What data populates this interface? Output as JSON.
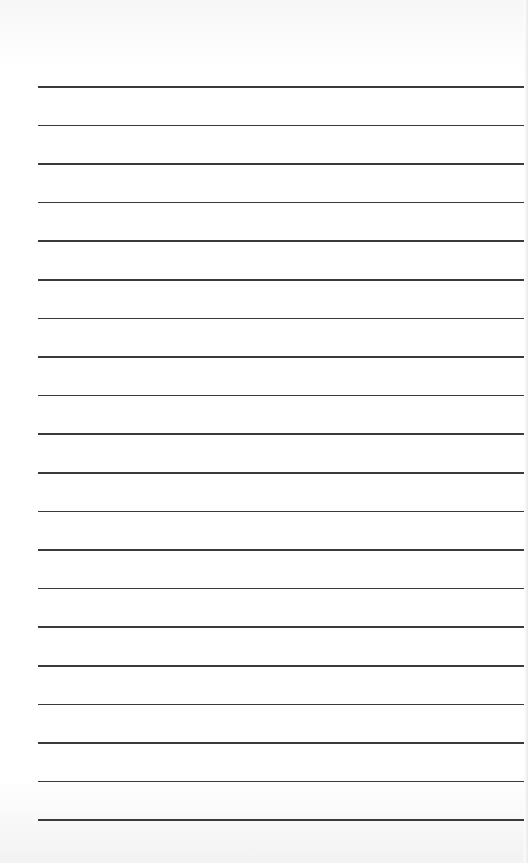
{
  "page": {
    "type": "lined-paper",
    "background_color": "#ffffff",
    "line_color": "#3a3a3a",
    "line_count": 20,
    "first_line_y": 86,
    "line_spacing": 38.6,
    "line_left_x": 38,
    "line_width": 486
  }
}
